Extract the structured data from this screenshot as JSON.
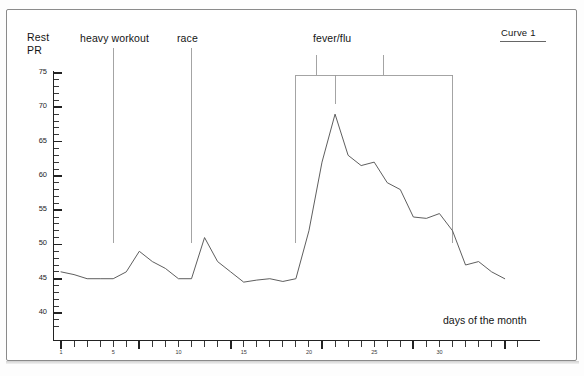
{
  "figure": {
    "y_axis_title_line1": "Rest",
    "y_axis_title_line2": "PR",
    "x_axis_title": "days of the month"
  },
  "legend": {
    "entries": [
      {
        "label": "Curve 1",
        "color": "#555555"
      }
    ]
  },
  "annotations": [
    {
      "name": "heavy-workout",
      "label": "heavy workout",
      "type": "line",
      "day": 5
    },
    {
      "name": "race",
      "label": "race",
      "type": "line",
      "day": 11
    },
    {
      "name": "fever-flu",
      "label": "fever/flu",
      "type": "bracket",
      "day_start": 19,
      "day_end": 31,
      "day_peak": 22
    }
  ],
  "chart_data": {
    "type": "line",
    "title": "",
    "subtitle": "",
    "xlabel": "days of the month",
    "ylabel": "Rest PR",
    "xlim": [
      0,
      36
    ],
    "ylim": [
      37,
      76
    ],
    "grid": false,
    "legend_position": "top-right",
    "ytick_labels": [
      "40",
      "45",
      "50",
      "55",
      "60",
      "65",
      "70",
      "75"
    ],
    "ytick_values": [
      40,
      45,
      50,
      55,
      60,
      65,
      70,
      75
    ],
    "yminor_step": 1,
    "xtick_labels": [
      "1",
      "5",
      "10",
      "15",
      "20",
      "25",
      "30"
    ],
    "xtick_values": [
      1,
      5,
      10,
      15,
      20,
      25,
      30
    ],
    "xminor_step": 1,
    "series": [
      {
        "name": "Curve 1",
        "color": "#555555",
        "x": [
          1,
          2,
          3,
          4,
          5,
          6,
          7,
          8,
          9,
          10,
          11,
          12,
          13,
          14,
          15,
          16,
          17,
          18,
          19,
          20,
          21,
          22,
          23,
          24,
          25,
          26,
          27,
          28,
          29,
          30,
          31,
          32,
          33,
          34,
          35
        ],
        "y": [
          46,
          45.6,
          45,
          45,
          45,
          46,
          49,
          47.5,
          46.5,
          45,
          45,
          51,
          47.5,
          46,
          44.5,
          44.8,
          45,
          44.6,
          45,
          52,
          62,
          69,
          63,
          61.5,
          62,
          59,
          58,
          54,
          53.8,
          54.5,
          52,
          47,
          47.5,
          46,
          45
        ]
      }
    ]
  }
}
